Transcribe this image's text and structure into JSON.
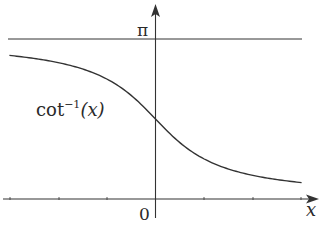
{
  "chart_data": {
    "type": "line",
    "title": "",
    "xlabel": "x",
    "ylabel": "",
    "function": "cot^-1(x)",
    "curve_label": "cot⁻¹(x)",
    "origin_label": "0",
    "y_reference_line": {
      "value": 3.14159,
      "label": "π"
    },
    "x_ticks": [
      -3,
      -2,
      -1,
      0,
      1,
      2,
      3
    ],
    "xlim": [
      -3.1,
      3.4
    ],
    "ylim": [
      -0.4,
      3.8
    ],
    "grid": false,
    "legend": null,
    "series": [
      {
        "name": "cot⁻¹(x)",
        "x": [
          -3,
          -2.5,
          -2,
          -1.5,
          -1,
          -0.5,
          0,
          0.5,
          1,
          1.5,
          2,
          2.5,
          3
        ],
        "y": [
          2.82,
          2.76,
          2.68,
          2.55,
          2.36,
          2.03,
          1.57,
          1.11,
          0.79,
          0.59,
          0.46,
          0.38,
          0.32
        ]
      }
    ]
  },
  "labels": {
    "pi": "π",
    "origin": "0",
    "x_axis": "x",
    "curve_name": "cot",
    "curve_sup": "−1",
    "curve_arg": "(x)"
  }
}
